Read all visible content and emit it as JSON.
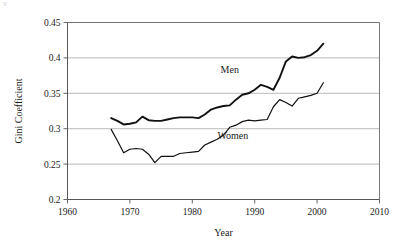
{
  "figure": {
    "scan_artifact": "v",
    "background_color": "#ffffff",
    "line_color": "#111111",
    "grid_color": "#a8a8a8"
  },
  "chart_data": {
    "type": "line",
    "title": "",
    "xlabel": "Year",
    "ylabel": "Gini Coefficient",
    "xlim": [
      1960,
      2010
    ],
    "ylim": [
      0.2,
      0.45
    ],
    "xticks": [
      1960,
      1970,
      1980,
      1990,
      2000,
      2010
    ],
    "xtick_labels": [
      "1960",
      "1970",
      "1980",
      "1990",
      "2000",
      "2010"
    ],
    "yticks": [
      0.2,
      0.25,
      0.3,
      0.35,
      0.4,
      0.45
    ],
    "ytick_labels": [
      "0.2",
      "0.25",
      "0.3",
      "0.35",
      "0.4",
      "0.45"
    ],
    "grid": "horizontal",
    "legend_position": "inline-annotations",
    "annotations": [
      {
        "text": "Men",
        "x": 1986.0,
        "y": 0.379
      },
      {
        "text": "Women",
        "x": 1986.5,
        "y": 0.286
      }
    ],
    "series": [
      {
        "name": "Men",
        "label": "Men",
        "color": "#111111",
        "x": [
          1967,
          1968,
          1969,
          1970,
          1971,
          1972,
          1973,
          1974,
          1975,
          1976,
          1977,
          1978,
          1979,
          1980,
          1981,
          1982,
          1983,
          1984,
          1985,
          1986,
          1987,
          1988,
          1989,
          1990,
          1991,
          1992,
          1993,
          1994,
          1995,
          1996,
          1997,
          1998,
          1999,
          2000,
          2001
        ],
        "values": [
          0.315,
          0.311,
          0.306,
          0.307,
          0.309,
          0.317,
          0.312,
          0.311,
          0.311,
          0.313,
          0.315,
          0.316,
          0.316,
          0.316,
          0.315,
          0.32,
          0.327,
          0.33,
          0.332,
          0.333,
          0.341,
          0.348,
          0.35,
          0.355,
          0.362,
          0.359,
          0.355,
          0.372,
          0.395,
          0.402,
          0.4,
          0.401,
          0.404,
          0.41,
          0.42
        ]
      },
      {
        "name": "Women",
        "label": "Women",
        "color": "#111111",
        "x": [
          1967,
          1968,
          1969,
          1970,
          1971,
          1972,
          1973,
          1974,
          1975,
          1976,
          1977,
          1978,
          1979,
          1980,
          1981,
          1982,
          1983,
          1984,
          1985,
          1986,
          1987,
          1988,
          1989,
          1990,
          1991,
          1992,
          1993,
          1994,
          1995,
          1996,
          1997,
          1998,
          1999,
          2000,
          2001
        ],
        "values": [
          0.299,
          0.283,
          0.266,
          0.271,
          0.272,
          0.271,
          0.264,
          0.252,
          0.261,
          0.261,
          0.261,
          0.265,
          0.266,
          0.267,
          0.268,
          0.277,
          0.281,
          0.285,
          0.291,
          0.302,
          0.305,
          0.31,
          0.312,
          0.311,
          0.312,
          0.313,
          0.331,
          0.341,
          0.337,
          0.332,
          0.343,
          0.345,
          0.347,
          0.35,
          0.365
        ]
      }
    ]
  }
}
